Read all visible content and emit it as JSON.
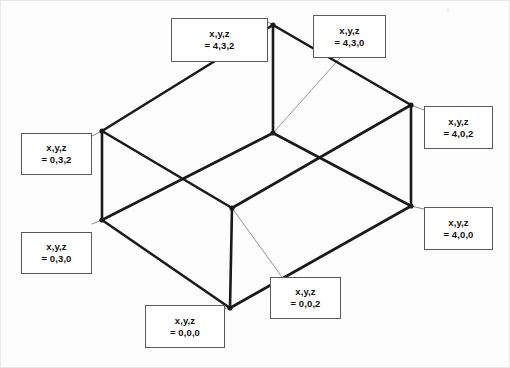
{
  "diagram": {
    "type": "3d-wireframe-box",
    "title_text": "",
    "edge_color": "#1a1a1a",
    "leader_color": "#8a8a8a",
    "box_border_color": "#5a5a5a",
    "background_color": "#fdfdfd",
    "vertices": [
      {
        "id": "v_4_3_2",
        "key": "x,y,z",
        "value": "= 4,3,2",
        "x": 273,
        "y": 25,
        "coords": [
          4,
          3,
          2
        ]
      },
      {
        "id": "v_4_3_0",
        "key": "x,y,z",
        "value": "= 4,3,0",
        "x": 273,
        "y": 133,
        "coords": [
          4,
          3,
          0
        ]
      },
      {
        "id": "v_0_3_2",
        "key": "x,y,z",
        "value": "= 0,3,2",
        "x": 102,
        "y": 131,
        "coords": [
          0,
          3,
          2
        ]
      },
      {
        "id": "v_0_3_0",
        "key": "x,y,z",
        "value": "= 0,3,0",
        "x": 102,
        "y": 220,
        "coords": [
          0,
          3,
          0
        ]
      },
      {
        "id": "v_4_0_2",
        "key": "x,y,z",
        "value": "= 4,0,2",
        "x": 411,
        "y": 105,
        "coords": [
          4,
          0,
          2
        ]
      },
      {
        "id": "v_4_0_0",
        "key": "x,y,z",
        "value": "= 4,0,0",
        "x": 411,
        "y": 206,
        "coords": [
          4,
          0,
          0
        ]
      },
      {
        "id": "v_0_0_2",
        "key": "x,y,z",
        "value": "= 0,0,2",
        "x": 232,
        "y": 208,
        "coords": [
          0,
          0,
          2
        ]
      },
      {
        "id": "v_0_0_0",
        "key": "x,y,z",
        "value": "= 0,0,0",
        "x": 230,
        "y": 308,
        "coords": [
          0,
          0,
          0
        ]
      }
    ],
    "labels": [
      {
        "id": "lbl_4_3_2",
        "key": "x,y,z",
        "value": "= 4,3,2",
        "x": 171,
        "y": 18,
        "w": 97,
        "h": 44
      },
      {
        "id": "lbl_4_3_0",
        "key": "x,y,z",
        "value": "= 4,3,0",
        "x": 313,
        "y": 15,
        "w": 73,
        "h": 43
      },
      {
        "id": "lbl_4_0_2",
        "key": "x,y,z",
        "value": "= 4,0,2",
        "x": 424,
        "y": 106,
        "w": 69,
        "h": 43
      },
      {
        "id": "lbl_4_0_0",
        "key": "x,y,z",
        "value": "= 4,0,0",
        "x": 424,
        "y": 207,
        "w": 69,
        "h": 43
      },
      {
        "id": "lbl_0_3_2",
        "key": "x,y,z",
        "value": "= 0,3,2",
        "x": 21,
        "y": 133,
        "w": 71,
        "h": 42
      },
      {
        "id": "lbl_0_3_0",
        "key": "x,y,z",
        "value": "= 0,3,0",
        "x": 21,
        "y": 232,
        "w": 71,
        "h": 42
      },
      {
        "id": "lbl_0_0_2",
        "key": "x,y,z",
        "value": "= 0,0,2",
        "x": 270,
        "y": 277,
        "w": 71,
        "h": 42
      },
      {
        "id": "lbl_0_0_0",
        "key": "x,y,z",
        "value": "= 0,0,0",
        "x": 145,
        "y": 305,
        "w": 80,
        "h": 43
      }
    ]
  }
}
